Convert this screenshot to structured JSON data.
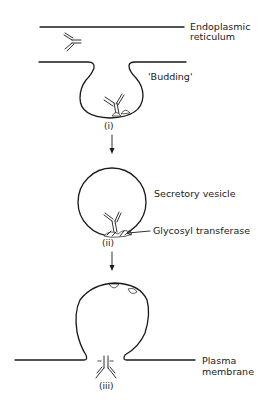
{
  "diagram": {
    "labels": {
      "er_line1": "Endoplasmic",
      "er_line2": "reticulum",
      "budding": "'Budding'",
      "vesicle": "Secretory vesicle",
      "enzyme": "Glycosyl transferase",
      "pm_line1": "Plasma",
      "pm_line2": "membrane"
    },
    "stages": {
      "one": "(i)",
      "two": "(ii)",
      "three": "(iii)"
    },
    "colors": {
      "ink": "#1a1a1a",
      "background": "#ffffff"
    }
  }
}
